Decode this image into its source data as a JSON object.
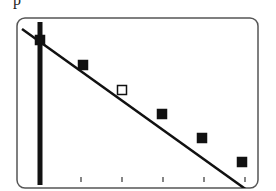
{
  "corner_label": "p",
  "diagram": {
    "frame": {
      "x": 17,
      "y": 18,
      "width": 241,
      "height": 170,
      "radius": 8,
      "stroke": "#555555"
    },
    "vertical_bar": {
      "x": 40,
      "y1": 22,
      "y2": 185,
      "width": 5,
      "color": "#111111"
    },
    "line": {
      "x1": 22,
      "y1": 29,
      "x2": 251,
      "y2": 193,
      "color": "#111111",
      "width": 2.5
    },
    "ticks": [
      81,
      122,
      163,
      204,
      245
    ],
    "markers": [
      {
        "x": 40,
        "y": 40,
        "filled": true
      },
      {
        "x": 83,
        "y": 65,
        "filled": true
      },
      {
        "x": 122,
        "y": 90,
        "filled": false
      },
      {
        "x": 162,
        "y": 114,
        "filled": true
      },
      {
        "x": 202,
        "y": 138,
        "filled": true
      },
      {
        "x": 242,
        "y": 162,
        "filled": true
      }
    ]
  }
}
